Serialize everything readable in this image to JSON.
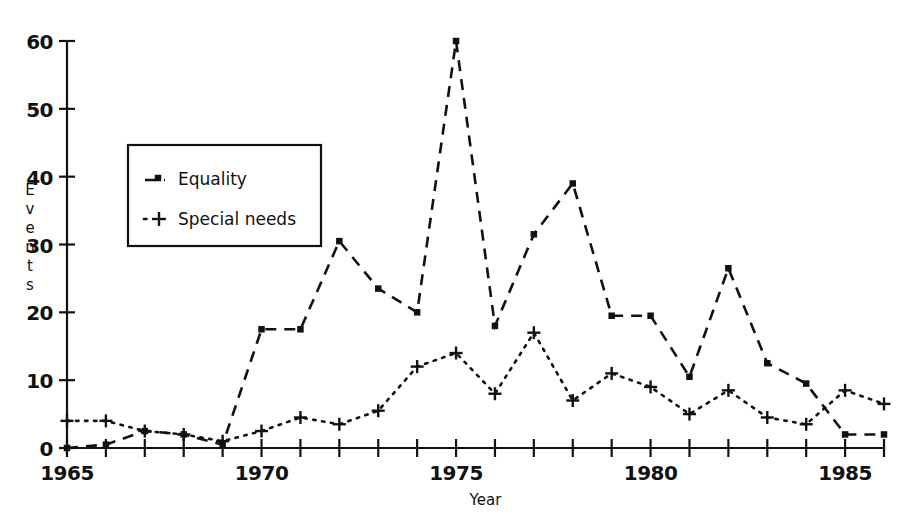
{
  "chart_data": {
    "type": "line",
    "title": "",
    "xlabel": "Year",
    "ylabel": "Events",
    "xlim": [
      1965,
      1986
    ],
    "ylim": [
      0,
      60
    ],
    "grid": false,
    "legend_position": "upper left inside",
    "x": [
      1965,
      1966,
      1967,
      1968,
      1969,
      1970,
      1971,
      1972,
      1973,
      1974,
      1975,
      1976,
      1977,
      1978,
      1979,
      1980,
      1981,
      1982,
      1983,
      1984,
      1985,
      1986
    ],
    "xtick_labels": [
      "1965",
      "1970",
      "1975",
      "1980",
      "1985"
    ],
    "xticks": [
      1965,
      1970,
      1975,
      1980,
      1985
    ],
    "ytick_labels": [
      "0",
      "10",
      "20",
      "30",
      "40",
      "50",
      "60"
    ],
    "yticks": [
      0,
      10,
      20,
      30,
      40,
      50,
      60
    ],
    "series": [
      {
        "name": "Equality",
        "marker": "square",
        "linestyle": "dashed",
        "values": [
          0,
          0.5,
          2.5,
          2,
          0.5,
          17.5,
          17.5,
          30.5,
          23.5,
          20,
          60,
          18,
          31.5,
          39,
          19.5,
          19.5,
          10.5,
          26.5,
          12.5,
          9.5,
          2,
          2
        ]
      },
      {
        "name": "Special needs",
        "marker": "plus",
        "linestyle": "dotted",
        "values": [
          4,
          4,
          2.5,
          2,
          1,
          2.5,
          4.5,
          3.5,
          5.5,
          12,
          14,
          8,
          17,
          7,
          11,
          9,
          5,
          8.5,
          4.5,
          3.5,
          8.5,
          6.5
        ]
      }
    ]
  },
  "legend": {
    "items": [
      {
        "label": "Equality",
        "marker": "square"
      },
      {
        "label": "Special needs",
        "marker": "plus"
      }
    ]
  },
  "axes": {
    "y_title": "Events",
    "x_title": "Year"
  }
}
